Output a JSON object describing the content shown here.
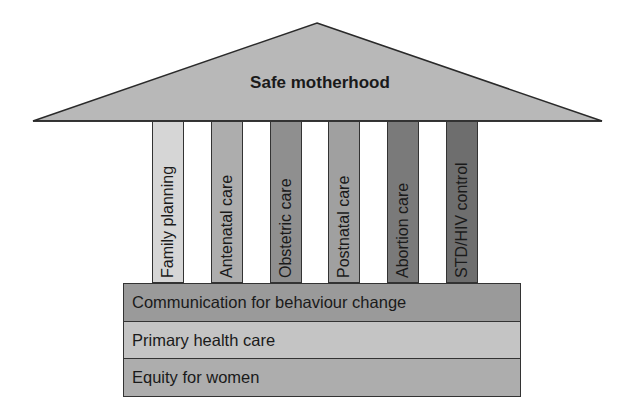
{
  "roof": {
    "title": "Safe motherhood",
    "color": "#b8b8b8"
  },
  "pillars": [
    {
      "label": "Family planning",
      "color": "#d6d6d6"
    },
    {
      "label": "Antenatal care",
      "color": "#adadad"
    },
    {
      "label": "Obstetric care",
      "color": "#8f8f8f"
    },
    {
      "label": "Postnatal care",
      "color": "#a0a0a0"
    },
    {
      "label": "Abortion care",
      "color": "#7a7a7a"
    },
    {
      "label": "STD/HIV control",
      "color": "#6e6e6e"
    }
  ],
  "foundation": [
    {
      "label": "Communication for behaviour change",
      "color": "#9a9a9a"
    },
    {
      "label": "Primary health care",
      "color": "#c4c4c4"
    },
    {
      "label": "Equity for women",
      "color": "#adadad"
    }
  ]
}
